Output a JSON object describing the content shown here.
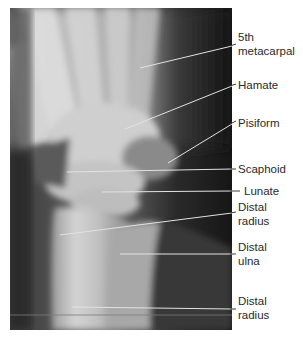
{
  "figure": {
    "type": "lateral wrist radiograph",
    "colors": {
      "background": "#ffffff",
      "label_text": "#2a2a2a",
      "leader_line": "#d8d8d8"
    }
  },
  "labels": [
    {
      "id": "fifth-metacarpal",
      "lines": [
        "5th",
        "metacarpal"
      ]
    },
    {
      "id": "hamate",
      "lines": [
        "Hamate"
      ]
    },
    {
      "id": "pisiform",
      "lines": [
        "Pisiform"
      ]
    },
    {
      "id": "scaphoid",
      "lines": [
        "Scaphoid"
      ]
    },
    {
      "id": "lunate",
      "lines": [
        "Lunate"
      ]
    },
    {
      "id": "distal-radius-upper",
      "lines": [
        "Distal",
        "radius"
      ]
    },
    {
      "id": "distal-ulna",
      "lines": [
        "Distal",
        "ulna"
      ]
    },
    {
      "id": "distal-radius-lower",
      "lines": [
        "Distal",
        "radius"
      ]
    }
  ]
}
